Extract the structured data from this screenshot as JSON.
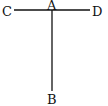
{
  "diagram": {
    "type": "geometry",
    "line_color": "#111111",
    "background": "#ffffff",
    "points": {
      "A": {
        "label": "A",
        "x": 52,
        "y": 10
      },
      "B": {
        "label": "B",
        "x": 52,
        "y": 91
      },
      "C": {
        "label": "C",
        "x": 14,
        "y": 10
      },
      "D": {
        "label": "D",
        "x": 90,
        "y": 10
      }
    },
    "segments": [
      {
        "name": "CD",
        "from": "C",
        "to": "D"
      },
      {
        "name": "AB",
        "from": "A",
        "to": "B"
      }
    ],
    "labels": {
      "A": "A",
      "B": "B",
      "C": "C",
      "D": "D"
    }
  }
}
